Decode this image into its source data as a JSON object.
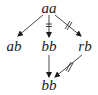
{
  "diagram": {
    "type": "directed-graph",
    "nodes": [
      {
        "id": "n_top",
        "label": "aa",
        "x": 49,
        "y": 8
      },
      {
        "id": "n_left",
        "label": "ab",
        "x": 14,
        "y": 46
      },
      {
        "id": "n_mid",
        "label": "bb",
        "x": 49,
        "y": 46
      },
      {
        "id": "n_right",
        "label": "rb",
        "x": 85,
        "y": 46
      },
      {
        "id": "n_bottom",
        "label": "bb",
        "x": 49,
        "y": 85
      }
    ],
    "edges": [
      {
        "from": "aa",
        "to": "ab",
        "mark": "none"
      },
      {
        "from": "aa",
        "to": "bb",
        "mark": "double-bar"
      },
      {
        "from": "aa",
        "to": "rb",
        "mark": "slash"
      },
      {
        "from": "bb",
        "to": "bb",
        "mark": "none"
      },
      {
        "from": "rb",
        "to": "bb",
        "mark": "slash"
      }
    ],
    "colors": {
      "line": "#1a1a1a",
      "background": "#ffffff"
    }
  }
}
